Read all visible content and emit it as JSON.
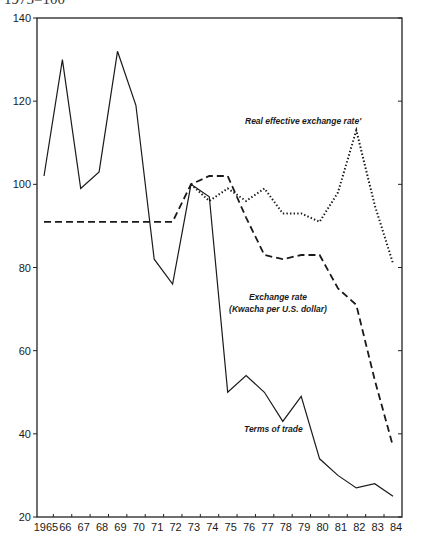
{
  "header": {
    "caption": "1975=100"
  },
  "chart_data": {
    "type": "line",
    "title": "",
    "subtitle": "1975=100",
    "xlabel": "",
    "ylabel": "",
    "x": [
      "1965",
      "66",
      "67",
      "68",
      "69",
      "70",
      "71",
      "72",
      "73",
      "74",
      "75",
      "76",
      "77",
      "78",
      "79",
      "80",
      "81",
      "82",
      "83",
      "84"
    ],
    "ylim": [
      20,
      140
    ],
    "yticks": [
      20,
      40,
      60,
      80,
      100,
      120,
      140
    ],
    "grid": false,
    "legend": "inline annotations",
    "series": [
      {
        "name": "Terms of trade",
        "style": "solid",
        "values": [
          102,
          130,
          99,
          103,
          132,
          119,
          82,
          76,
          100,
          97,
          50,
          54,
          50,
          43,
          49,
          34,
          30,
          27,
          28,
          25
        ]
      },
      {
        "name": "Exchange rate (Kwacha per U.S. dollar)",
        "style": "dashed",
        "values": [
          91,
          91,
          91,
          91,
          91,
          91,
          91,
          91,
          100,
          102,
          102,
          92,
          83,
          82,
          83,
          83,
          75,
          71,
          53,
          37
        ]
      },
      {
        "name": "Real effective exchange rate'",
        "style": "dotted",
        "values": [
          null,
          null,
          null,
          null,
          null,
          null,
          null,
          null,
          100,
          96,
          99,
          96,
          99,
          93,
          93,
          91,
          98,
          113,
          95,
          81
        ]
      }
    ],
    "annotations": [
      {
        "text": "Real effective exchange rate'",
        "x": 245,
        "y": 124,
        "lines": [
          "Real effective exchange rate'"
        ]
      },
      {
        "text": "Exchange rate (Kwacha per U.S. dollar)",
        "x": 278,
        "y": 300,
        "lines": [
          "Exchange rate",
          "(Kwacha per U.S. dollar)"
        ]
      },
      {
        "text": "Terms of trade",
        "x": 244,
        "y": 432,
        "lines": [
          "Terms of trade"
        ]
      }
    ]
  }
}
